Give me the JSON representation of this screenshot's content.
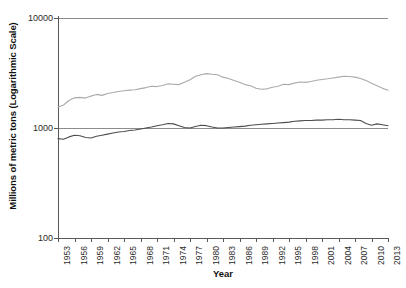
{
  "chart_data": {
    "type": "line",
    "title": "",
    "xlabel": "Year",
    "ylabel": "Millions of metric tons (Logarithmic Scale)",
    "yscale": "log",
    "ylim": [
      100,
      10000
    ],
    "ytick_labels": [
      "10000",
      "1000",
      "100"
    ],
    "ytick_values": [
      10000,
      1000,
      100
    ],
    "xlim": [
      1953,
      2013
    ],
    "xtick_labels": [
      "1953",
      "1956",
      "1959",
      "1962",
      "1965",
      "1968",
      "1971",
      "1974",
      "1977",
      "1980",
      "1983",
      "1986",
      "1989",
      "1992",
      "1995",
      "1998",
      "2001",
      "2004",
      "2007",
      "2010",
      "2013"
    ],
    "grid": true,
    "legend": "none",
    "x": [
      1953,
      1954,
      1955,
      1956,
      1957,
      1958,
      1959,
      1960,
      1961,
      1962,
      1963,
      1964,
      1965,
      1966,
      1967,
      1968,
      1969,
      1970,
      1971,
      1972,
      1973,
      1974,
      1975,
      1976,
      1977,
      1978,
      1979,
      1980,
      1981,
      1982,
      1983,
      1984,
      1985,
      1986,
      1987,
      1988,
      1989,
      1990,
      1991,
      1992,
      1993,
      1994,
      1995,
      1996,
      1997,
      1998,
      1999,
      2000,
      2001,
      2002,
      2003,
      2004,
      2005,
      2006,
      2007,
      2008,
      2009,
      2010,
      2011,
      2012,
      2013
    ],
    "series": [
      {
        "name": "upper-series",
        "color": "#aaaaaa",
        "values": [
          1550,
          1620,
          1780,
          1880,
          1900,
          1870,
          1950,
          2020,
          1980,
          2060,
          2100,
          2150,
          2180,
          2210,
          2230,
          2280,
          2330,
          2400,
          2380,
          2430,
          2520,
          2500,
          2480,
          2600,
          2750,
          2950,
          3050,
          3120,
          3080,
          3050,
          2900,
          2820,
          2700,
          2600,
          2480,
          2420,
          2300,
          2250,
          2270,
          2350,
          2400,
          2500,
          2480,
          2560,
          2620,
          2600,
          2650,
          2720,
          2760,
          2800,
          2850,
          2900,
          2950,
          2940,
          2900,
          2820,
          2700,
          2550,
          2420,
          2300,
          2200
        ]
      },
      {
        "name": "lower-series",
        "color": "#4d4d4d",
        "values": [
          800,
          790,
          830,
          860,
          850,
          820,
          810,
          840,
          860,
          880,
          900,
          920,
          930,
          950,
          960,
          980,
          1000,
          1020,
          1050,
          1070,
          1100,
          1090,
          1050,
          1010,
          1000,
          1030,
          1060,
          1050,
          1020,
          1000,
          1000,
          1010,
          1020,
          1030,
          1040,
          1060,
          1070,
          1080,
          1090,
          1100,
          1110,
          1120,
          1130,
          1150,
          1160,
          1170,
          1170,
          1180,
          1180,
          1190,
          1190,
          1200,
          1190,
          1190,
          1180,
          1170,
          1100,
          1060,
          1090,
          1070,
          1050
        ]
      }
    ]
  }
}
